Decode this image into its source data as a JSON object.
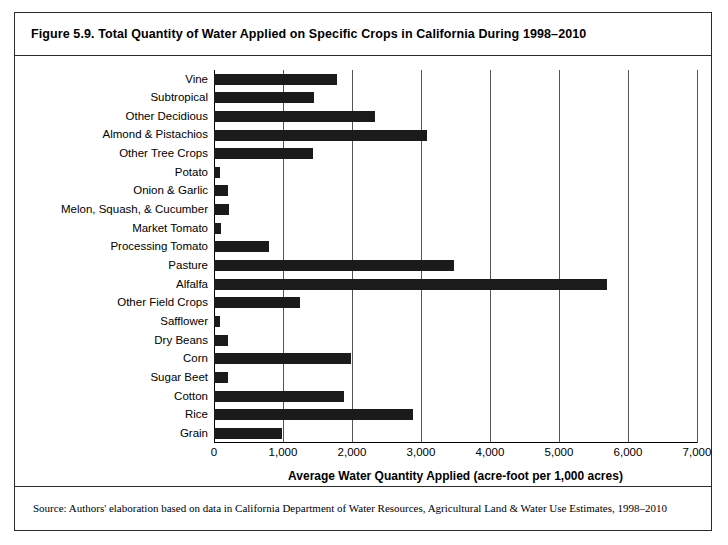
{
  "figure": {
    "title": "Figure 5.9. Total Quantity of Water Applied on Specific Crops in California During 1998–2010",
    "source": "Source: Authors' elaboration based on data in California Department of Water Resources, Agricultural Land & Water Use Estimates, 1998–2010"
  },
  "chart_data": {
    "type": "bar",
    "orientation": "horizontal",
    "title": "Figure 5.9. Total Quantity of Water Applied on Specific Crops in California During 1998–2010",
    "xlabel": "Average Water Quantity Applied (acre-foot per 1,000 acres)",
    "ylabel": "",
    "xlim": [
      0,
      7000
    ],
    "xticks": [
      0,
      1000,
      2000,
      3000,
      4000,
      5000,
      6000,
      7000
    ],
    "xtick_labels": [
      "0",
      "1,000",
      "2,000",
      "3,000",
      "4,000",
      "5,000",
      "6,000",
      "7,000"
    ],
    "grid": true,
    "grid_axis": "x",
    "legend": false,
    "bar_color": "#1b1b1b",
    "categories": [
      "Vine",
      "Subtropical",
      "Other Decidious",
      "Almond & Pistachios",
      "Other Tree Crops",
      "Potato",
      "Onion & Garlic",
      "Melon, Squash, & Cucumber",
      "Market Tomato",
      "Processing Tomato",
      "Pasture",
      "Alfalfa",
      "Other Field Crops",
      "Safflower",
      "Dry Beans",
      "Corn",
      "Sugar Beet",
      "Cotton",
      "Rice",
      "Grain"
    ],
    "values": [
      1780,
      1450,
      2330,
      3090,
      1440,
      90,
      210,
      220,
      100,
      800,
      3480,
      5700,
      1250,
      90,
      200,
      1980,
      200,
      1880,
      2880,
      980
    ]
  }
}
